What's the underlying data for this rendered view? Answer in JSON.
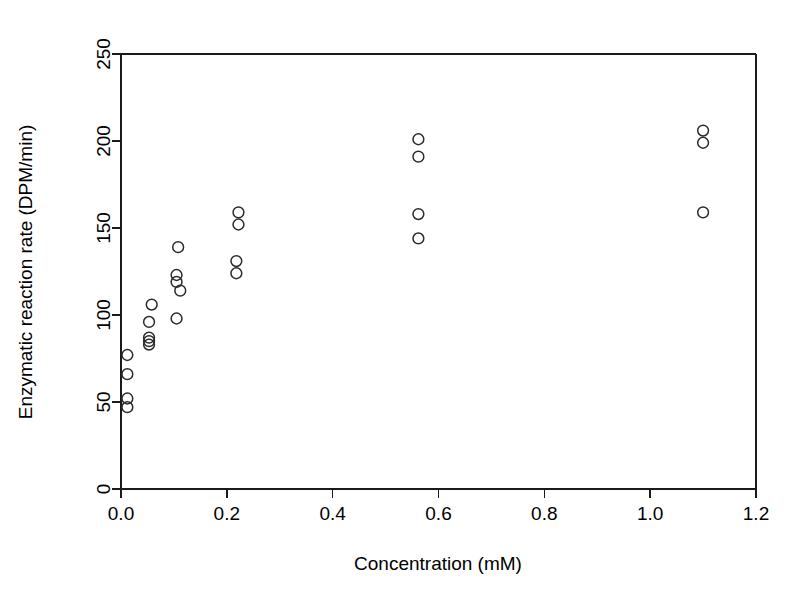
{
  "chart_data": {
    "type": "scatter",
    "title": "",
    "xlabel": "Concentration (mM)",
    "ylabel": "Enzymatic reaction rate (DPM/min)",
    "xlim": [
      0.0,
      1.2
    ],
    "ylim": [
      0,
      250
    ],
    "xticks": [
      "0.0",
      "0.2",
      "0.4",
      "0.6",
      "0.8",
      "1.0",
      "1.2"
    ],
    "xtick_values": [
      0.0,
      0.2,
      0.4,
      0.6,
      0.8,
      1.0,
      1.2
    ],
    "yticks": [
      "0",
      "50",
      "100",
      "150",
      "200",
      "250"
    ],
    "ytick_values": [
      0,
      50,
      100,
      150,
      200,
      250
    ],
    "grid": false,
    "legend": null,
    "marker": "open-circle",
    "marker_color": "#2b2b2b",
    "points": [
      {
        "x": 0.012,
        "y": 77
      },
      {
        "x": 0.012,
        "y": 66
      },
      {
        "x": 0.012,
        "y": 52
      },
      {
        "x": 0.012,
        "y": 47
      },
      {
        "x": 0.058,
        "y": 106
      },
      {
        "x": 0.053,
        "y": 96
      },
      {
        "x": 0.053,
        "y": 87
      },
      {
        "x": 0.053,
        "y": 85
      },
      {
        "x": 0.053,
        "y": 83
      },
      {
        "x": 0.108,
        "y": 139
      },
      {
        "x": 0.105,
        "y": 123
      },
      {
        "x": 0.105,
        "y": 119
      },
      {
        "x": 0.112,
        "y": 114
      },
      {
        "x": 0.105,
        "y": 98
      },
      {
        "x": 0.222,
        "y": 159
      },
      {
        "x": 0.222,
        "y": 152
      },
      {
        "x": 0.218,
        "y": 131
      },
      {
        "x": 0.218,
        "y": 124
      },
      {
        "x": 0.562,
        "y": 201
      },
      {
        "x": 0.562,
        "y": 191
      },
      {
        "x": 0.562,
        "y": 158
      },
      {
        "x": 0.562,
        "y": 144
      },
      {
        "x": 1.1,
        "y": 206
      },
      {
        "x": 1.1,
        "y": 199
      },
      {
        "x": 1.1,
        "y": 159
      }
    ]
  }
}
